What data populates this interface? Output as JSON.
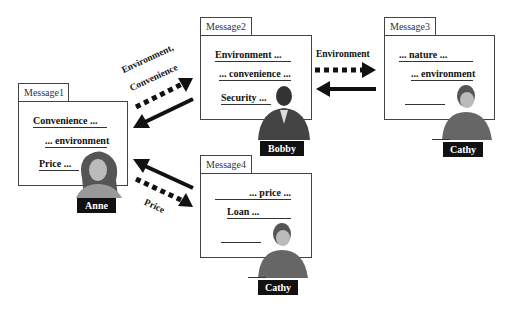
{
  "messages": [
    {
      "tab": "Message1",
      "lines": [
        "Convenience ...",
        "... environment",
        "Price ..."
      ],
      "person": "Anne"
    },
    {
      "tab": "Message2",
      "lines": [
        "Environment ...",
        "... convenience ...",
        "Security ..."
      ],
      "person": "Bobby"
    },
    {
      "tab": "Message3",
      "lines": [
        "... nature ...",
        "... environment"
      ],
      "person": "Cathy"
    },
    {
      "tab": "Message4",
      "lines": [
        "... price ...",
        "Loan ..."
      ],
      "person": "Cathy"
    }
  ],
  "arrows": {
    "m1_m2_label_1": "Environment,",
    "m1_m2_label_2": "Convenience",
    "m2_m3_label": "Environment",
    "m1_m4_label": "Price"
  }
}
